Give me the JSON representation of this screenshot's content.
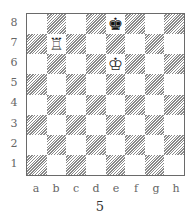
{
  "diagram": {
    "caption": "5",
    "ranks": [
      "8",
      "7",
      "6",
      "5",
      "4",
      "3",
      "2",
      "1"
    ],
    "files": [
      "a",
      "b",
      "c",
      "d",
      "e",
      "f",
      "g",
      "h"
    ],
    "pieces": [
      {
        "square": "e8",
        "color": "black",
        "type": "king",
        "glyph": "♚"
      },
      {
        "square": "b7",
        "color": "white",
        "type": "rook",
        "glyph": "♖"
      },
      {
        "square": "e6",
        "color": "white",
        "type": "king",
        "glyph": "♔"
      }
    ],
    "colors": {
      "border": "#6a6a6a",
      "hatch": "#8a8a8a",
      "light_square": "#ffffff"
    }
  }
}
